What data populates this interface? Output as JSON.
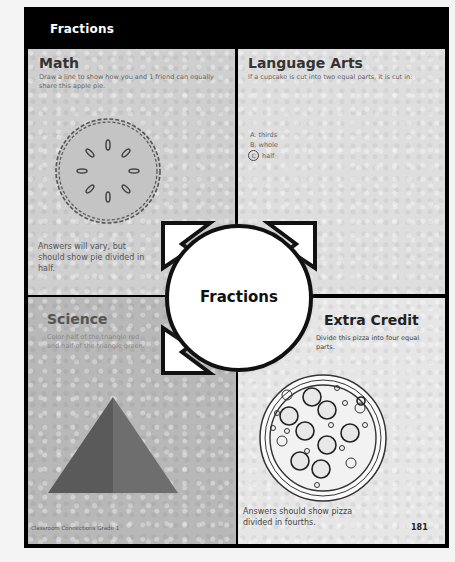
{
  "header": {
    "title": "Fractions"
  },
  "sections": {
    "math": {
      "heading": "Math",
      "instruction": "Draw a line to show how you and 1 friend can equally share this apple pie.",
      "illustration": "apple-pie",
      "answer": "Answers will vary, but should show pie divided in half."
    },
    "language_arts": {
      "heading": "Language Arts",
      "question": "If a cupcake is cut into two equal parts, it is cut in:",
      "options": [
        {
          "letter": "A.",
          "text": "thirds",
          "selected": false
        },
        {
          "letter": "B.",
          "text": "whole",
          "selected": false
        },
        {
          "letter": "C",
          "text": "half",
          "selected": true
        }
      ]
    },
    "center": {
      "title": "Fractions"
    },
    "science": {
      "heading": "Science",
      "instruction": "Color half of the triangle red and half of the triangle green.",
      "illustration": "triangle-halves"
    },
    "extra_credit": {
      "heading": "Extra Credit",
      "instruction": "Divide this pizza into four equal parts.",
      "illustration": "pepperoni-pizza",
      "answer": "Answers should show pizza divided in fourths."
    }
  },
  "footer": {
    "source": "Classroom Connections  Grade 1",
    "page_number": "181"
  },
  "colors": {
    "frame": "#000000",
    "triangle_left": "#5a5a5a",
    "triangle_right": "#6e6e6e"
  }
}
